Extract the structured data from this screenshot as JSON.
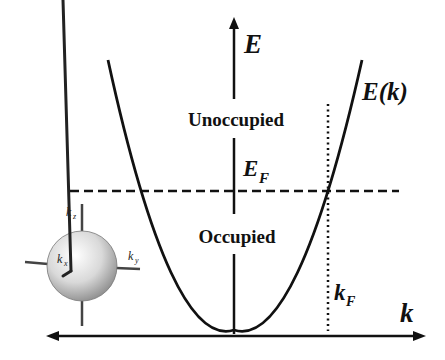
{
  "figure": {
    "type": "free-electron dispersion diagram",
    "axes": {
      "vertical_label": "E",
      "horizontal_label": "k"
    },
    "curve_label": "E(k)",
    "fermi_energy_label": {
      "main": "E",
      "sub": "F"
    },
    "fermi_wavevector_label": {
      "main": "k",
      "sub": "F"
    },
    "regions": {
      "above": "Unoccupied",
      "below": "Occupied"
    },
    "sphere_axes": {
      "x": {
        "main": "k",
        "sub": "x"
      },
      "y": {
        "main": "k",
        "sub": "y"
      },
      "z": {
        "main": "k",
        "sub": "z"
      }
    },
    "colors": {
      "ink": "#111111",
      "sphere_light": "#ffffff",
      "sphere_dark": "#8a8a8a",
      "background": "#ffffff"
    }
  }
}
